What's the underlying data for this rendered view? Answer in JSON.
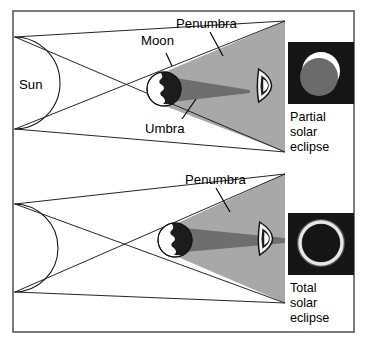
{
  "figure": {
    "border_color": "#5a5a5a",
    "background": "#ffffff"
  },
  "colors": {
    "penumbra_gray": "#a8a8a8",
    "umbra_gray": "#6e6e6e",
    "moon_dark": "#1c1c1c",
    "moon_light": "#ffffff",
    "photo_background": "#151515",
    "sun_disk_in_photo": "#ffffff",
    "moon_disk_in_photo": "#6b6b6b",
    "line_color": "#1a1a1a",
    "text_color": "#000000"
  },
  "panels": [
    {
      "id": "partial-eclipse-panel",
      "labels": {
        "sun": "Sun",
        "moon": "Moon",
        "penumbra": "Penumbra",
        "umbra": "Umbra"
      },
      "photo": {
        "name": "partial-solar-eclipse-photo",
        "type": "partial",
        "description": "Gray moon disk covering part of a white sun, on black sky"
      },
      "caption_lines": [
        "Partial",
        "solar",
        "eclipse"
      ],
      "observer_icon": "eye-icon"
    },
    {
      "id": "total-eclipse-panel",
      "labels": {
        "sun": "",
        "moon": "",
        "penumbra": "Penumbra",
        "umbra": ""
      },
      "photo": {
        "name": "total-solar-eclipse-photo",
        "type": "total",
        "description": "White corona ring around a black moon disk on black sky"
      },
      "caption_lines": [
        "Total",
        "solar",
        "eclipse"
      ],
      "observer_icon": "eye-icon"
    }
  ]
}
